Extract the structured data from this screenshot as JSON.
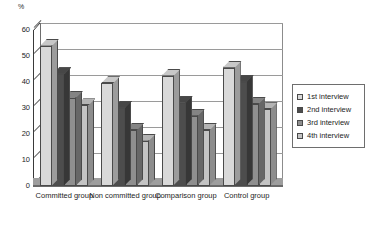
{
  "chart_data": {
    "type": "bar",
    "title": "",
    "subtitle": "",
    "xlabel": "",
    "ylabel": "%",
    "ylim": [
      0,
      60
    ],
    "ytick_step": 10,
    "ytick_labels": [
      "0",
      "10",
      "20",
      "30",
      "40",
      "50",
      "60"
    ],
    "grid": true,
    "grid_axis": "y",
    "legend_position": "right",
    "style": "3d-clustered-column",
    "categories": [
      "Committed group",
      "Non committed group",
      "Comparison group",
      "Control group"
    ],
    "series": [
      {
        "name": "1st interview",
        "color": "#d9d9d9",
        "values": [
          54,
          39.5,
          42.5,
          45.5
        ]
      },
      {
        "name": "2nd interview",
        "color": "#4d4d4d",
        "values": [
          43,
          30,
          32,
          40
        ]
      },
      {
        "name": "3rd interview",
        "color": "#8f8f8f",
        "values": [
          34,
          21.5,
          27,
          31.5
        ]
      },
      {
        "name": "4th interview",
        "color": "#c4c4c4",
        "values": [
          31,
          17.5,
          21.5,
          29.5
        ]
      }
    ]
  },
  "axis": {
    "unit_label": "%"
  },
  "legend": {
    "items": [
      {
        "label": "1st interview",
        "color": "#d9d9d9"
      },
      {
        "label": "2nd interview",
        "color": "#4d4d4d"
      },
      {
        "label": "3rd interview",
        "color": "#8f8f8f"
      },
      {
        "label": "4th interview",
        "color": "#c4c4c4"
      }
    ]
  }
}
